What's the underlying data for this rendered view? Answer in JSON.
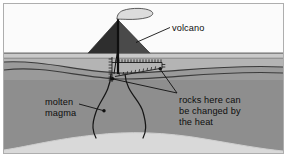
{
  "figure": {
    "kind": "cross-section-diagram",
    "background_color": "#ffffff",
    "frame_border_color": "#aeaeae"
  },
  "labels": {
    "volcano": "volcano",
    "magma": "molten\nmagma",
    "magma_line1": "molten",
    "magma_line2": "magma",
    "rocks": "rocks here can\nbe changed by\nthe heat",
    "rocks_line1": "rocks here can",
    "rocks_line2": "be changed by",
    "rocks_line3": "the heat"
  },
  "colors": {
    "sky": "#fbfbfb",
    "surface_band": "#c9c9c9",
    "surface_line": "#6e6e6e",
    "layer_1": "#b4b4b4",
    "layer_2": "#9a9a9a",
    "layer_3": "#8e8e8e",
    "layer_4": "#8a8a8a",
    "layer_line": "#3b3b3b",
    "magma_chamber": "#d9d9d9",
    "cone_dark": "#2e2e2e",
    "cone_light": "#4a4a4a",
    "smoke_fill": "#dcdcdc",
    "smoke_stroke": "#4a4a4a",
    "conduit": "#161616",
    "leader_line": "#111111",
    "hatch": "#1a1a1a",
    "text": "#0d0d0d"
  },
  "elements": {
    "smoke_plume": "smoke-plume",
    "volcano_cone": "volcano-cone",
    "vent_conduit": "vent-conduit",
    "magma_chamber": "magma-chamber",
    "magma_conduit_left": "magma-conduit-left",
    "magma_conduit_right": "magma-conduit-right",
    "metamorphic_aureole": "metamorphic-aureole",
    "rock_layers": "rock-strata-layers",
    "ground_surface": "ground-surface"
  }
}
